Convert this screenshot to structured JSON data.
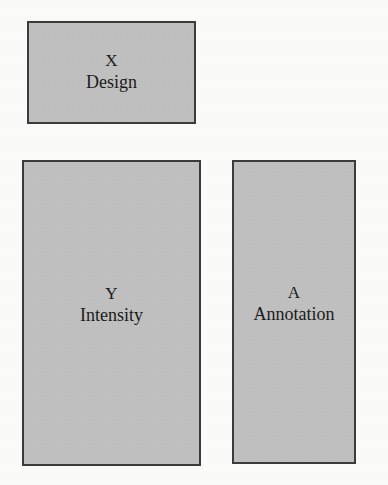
{
  "page": {
    "background_color": "#fdfdfc",
    "box_fill_color": "#bebebe",
    "box_border_color": "#3b3b3b",
    "text_color": "#1b1b1b"
  },
  "diagram": {
    "type": "block-diagram",
    "nodes": [
      {
        "id": "design",
        "symbol": "X",
        "label": "Design",
        "x": 27,
        "y": 21,
        "width": 169,
        "height": 103
      },
      {
        "id": "intensity",
        "symbol": "Y",
        "label": "Intensity",
        "x": 22,
        "y": 160,
        "width": 179,
        "height": 306
      },
      {
        "id": "annotation",
        "symbol": "A",
        "label": "Annotation",
        "x": 232,
        "y": 160,
        "width": 124,
        "height": 304
      }
    ]
  },
  "artifacts": {
    "bleed_through": [
      {
        "text": "",
        "x": 18,
        "y": 138
      },
      {
        "text": "",
        "x": 14,
        "y": 143
      }
    ]
  }
}
